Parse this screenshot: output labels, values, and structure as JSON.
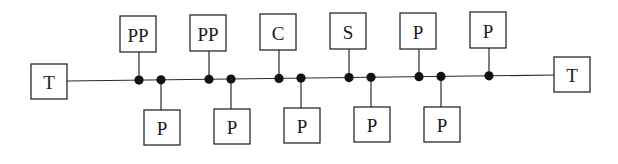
{
  "diagram": {
    "type": "bus-topology",
    "bus": {
      "x1": 67,
      "y1": 81,
      "x2": 554,
      "y2": 75
    },
    "colors": {
      "line": "#2a2a2a",
      "node": "#111111",
      "box_fill": "#ffffff"
    },
    "terminators": [
      {
        "id": "term-left",
        "label": "T",
        "x": 31,
        "y": 64,
        "w": 36,
        "h": 35
      },
      {
        "id": "term-right",
        "label": "T",
        "x": 554,
        "y": 57,
        "w": 36,
        "h": 35
      }
    ],
    "stations": [
      {
        "id": "s1",
        "label": "PP",
        "side": "top",
        "tap_x": 139,
        "box_x": 120,
        "box_y": 16,
        "w": 36,
        "h": 36
      },
      {
        "id": "s2",
        "label": "P",
        "side": "bottom",
        "tap_x": 161,
        "box_x": 144,
        "box_y": 110,
        "w": 36,
        "h": 35
      },
      {
        "id": "s3",
        "label": "PP",
        "side": "top",
        "tap_x": 209,
        "box_x": 190,
        "box_y": 15,
        "w": 36,
        "h": 36
      },
      {
        "id": "s4",
        "label": "P",
        "side": "bottom",
        "tap_x": 231,
        "box_x": 214,
        "box_y": 109,
        "w": 36,
        "h": 35
      },
      {
        "id": "s5",
        "label": "C",
        "side": "top",
        "tap_x": 279,
        "box_x": 260,
        "box_y": 14,
        "w": 36,
        "h": 36
      },
      {
        "id": "s6",
        "label": "P",
        "side": "bottom",
        "tap_x": 301,
        "box_x": 284,
        "box_y": 108,
        "w": 36,
        "h": 35
      },
      {
        "id": "s7",
        "label": "S",
        "side": "top",
        "tap_x": 349,
        "box_x": 330,
        "box_y": 13,
        "w": 36,
        "h": 36
      },
      {
        "id": "s8",
        "label": "P",
        "side": "bottom",
        "tap_x": 371,
        "box_x": 354,
        "box_y": 107,
        "w": 36,
        "h": 35
      },
      {
        "id": "s9",
        "label": "P",
        "side": "top",
        "tap_x": 419,
        "box_x": 400,
        "box_y": 13,
        "w": 36,
        "h": 36
      },
      {
        "id": "s10",
        "label": "P",
        "side": "bottom",
        "tap_x": 441,
        "box_x": 424,
        "box_y": 107,
        "w": 36,
        "h": 35
      },
      {
        "id": "s11",
        "label": "P",
        "side": "top",
        "tap_x": 489,
        "box_x": 470,
        "box_y": 12,
        "w": 36,
        "h": 36
      }
    ]
  }
}
